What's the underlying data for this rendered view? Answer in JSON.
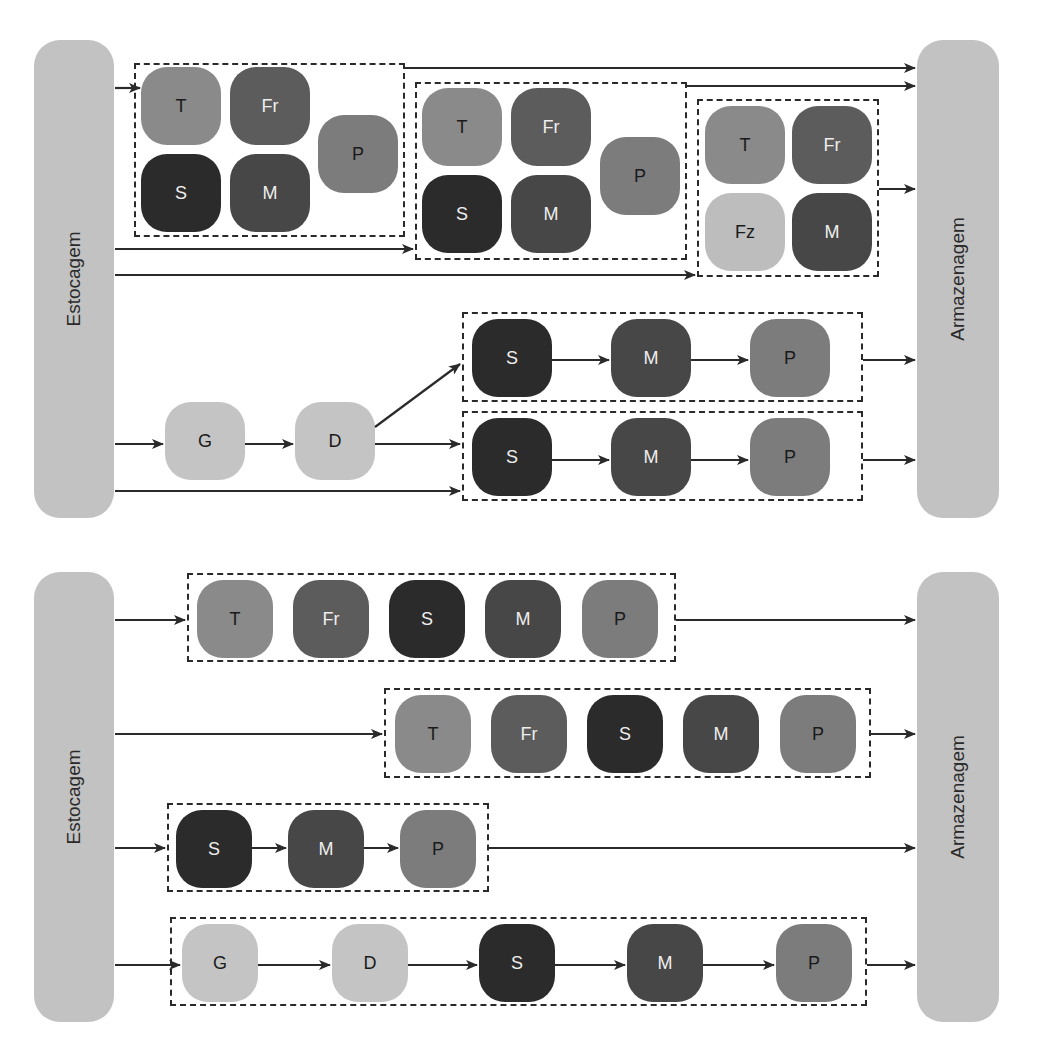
{
  "colors": {
    "T": {
      "fill": "#8a8a8a",
      "text": "#1a1a1a"
    },
    "Fr": {
      "fill": "#5c5c5c",
      "text": "#eeeeee"
    },
    "S": {
      "fill": "#2b2b2b",
      "text": "#eeeeee"
    },
    "M": {
      "fill": "#474747",
      "text": "#eeeeee"
    },
    "P": {
      "fill": "#7c7c7c",
      "text": "#1a1a1a"
    },
    "Fz": {
      "fill": "#bdbdbd",
      "text": "#1a1a1a"
    },
    "G": {
      "fill": "#c4c4c4",
      "text": "#1a1a1a"
    },
    "D": {
      "fill": "#c4c4c4",
      "text": "#1a1a1a"
    },
    "bar": "#c2c2c2",
    "line": "#2a2a2a"
  },
  "top_diagram": {
    "source_label": "Estocagem",
    "sink_label": "Armazenagem",
    "groups": [
      {
        "nodes": [
          "T",
          "Fr",
          "S",
          "M",
          "P"
        ]
      },
      {
        "nodes": [
          "T",
          "Fr",
          "S",
          "M",
          "P"
        ]
      },
      {
        "nodes": [
          "T",
          "Fr",
          "Fz",
          "M"
        ]
      },
      {
        "nodes": [
          "S",
          "M",
          "P"
        ]
      },
      {
        "nodes": [
          "S",
          "M",
          "P"
        ]
      }
    ],
    "pre_nodes": [
      "G",
      "D"
    ]
  },
  "bottom_diagram": {
    "source_label": "Estocagem",
    "sink_label": "Armazenagem",
    "rows": [
      {
        "nodes": [
          "T",
          "Fr",
          "S",
          "M",
          "P"
        ]
      },
      {
        "nodes": [
          "T",
          "Fr",
          "S",
          "M",
          "P"
        ]
      },
      {
        "nodes": [
          "S",
          "M",
          "P"
        ]
      },
      {
        "nodes": [
          "G",
          "D",
          "S",
          "M",
          "P"
        ]
      }
    ]
  }
}
